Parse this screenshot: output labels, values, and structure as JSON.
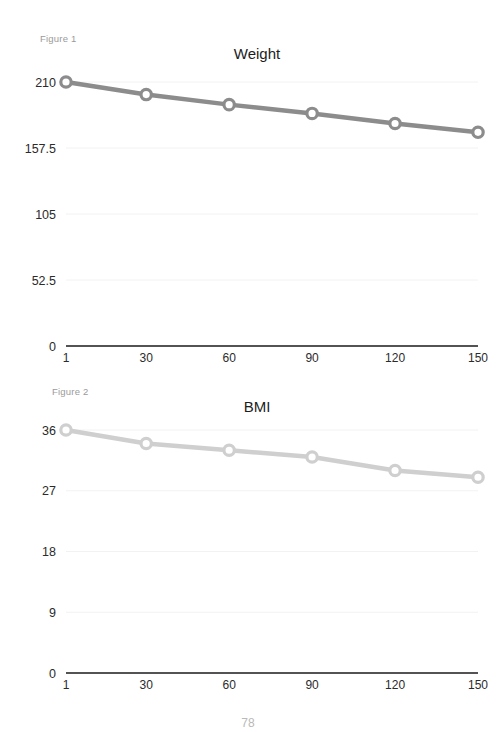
{
  "document": {
    "page_number": "78"
  },
  "figures": [
    {
      "caption": "Figure 1",
      "title": "Weight",
      "name": "weight-chart"
    },
    {
      "caption": "Figure 2",
      "title": "BMI",
      "name": "bmi-chart"
    }
  ],
  "chart_data": [
    {
      "type": "line",
      "title": "Weight",
      "caption": "Figure 1",
      "xlabel": "",
      "ylabel": "",
      "x": [
        1,
        30,
        60,
        90,
        120,
        150
      ],
      "categories": [
        "1",
        "30",
        "60",
        "90",
        "120",
        "150"
      ],
      "values": [
        210,
        200,
        192,
        185,
        177,
        170
      ],
      "xtick_labels": [
        "1",
        "30",
        "60",
        "90",
        "120",
        "150"
      ],
      "ytick_labels": [
        "0",
        "52.5",
        "105",
        "157.5",
        "210"
      ],
      "ytick_values": [
        0,
        52.5,
        105,
        157.5,
        210
      ],
      "ylim": [
        0,
        210
      ],
      "xlim": [
        1,
        150
      ],
      "grid": true,
      "legend": false,
      "line_color": "#8c8c8c",
      "marker_fill": "#ffffff",
      "marker_stroke": "#8c8c8c"
    },
    {
      "type": "line",
      "title": "BMI",
      "caption": "Figure 2",
      "xlabel": "",
      "ylabel": "",
      "x": [
        1,
        30,
        60,
        90,
        120,
        150
      ],
      "categories": [
        "1",
        "30",
        "60",
        "90",
        "120",
        "150"
      ],
      "values": [
        36,
        34,
        33,
        32,
        30,
        29
      ],
      "xtick_labels": [
        "1",
        "30",
        "60",
        "90",
        "120",
        "150"
      ],
      "ytick_labels": [
        "0",
        "9",
        "18",
        "27",
        "36"
      ],
      "ytick_values": [
        0,
        9,
        18,
        27,
        36
      ],
      "ylim": [
        0,
        36
      ],
      "xlim": [
        1,
        150
      ],
      "grid": true,
      "legend": false,
      "line_color": "#cfcfcf",
      "marker_fill": "#ffffff",
      "marker_stroke": "#cfcfcf"
    }
  ]
}
